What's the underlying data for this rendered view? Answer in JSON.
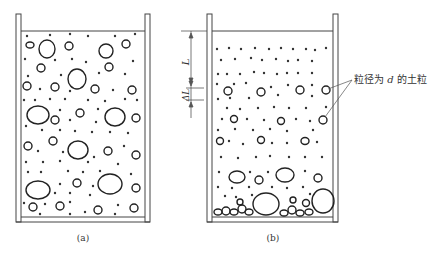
{
  "figure": {
    "panels": [
      {
        "id": "a",
        "caption": "(a)",
        "description": "mixed soil particles uniformly suspended in water column"
      },
      {
        "id": "b",
        "caption": "(b)",
        "description": "particles settling; coarse grains accumulated at bottom"
      }
    ],
    "dimensions": {
      "L_label": "L",
      "delta_L_label": "ΔL"
    },
    "annotation": {
      "text": "粒径为 d 的土粒",
      "prefix": "粒径为 ",
      "variable": "d",
      "suffix": " 的土粒"
    },
    "colors": {
      "ink": "#222222",
      "wall": "#444444",
      "background": "#ffffff"
    }
  }
}
